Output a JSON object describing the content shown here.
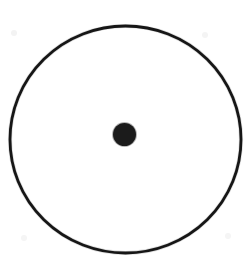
{
  "figure": {
    "title": "Circle with marked centre point",
    "background_color": "#ffffff",
    "canvas": {
      "width": 252,
      "height": 266
    },
    "elements": [
      {
        "name": "outer-circle",
        "kind": "circle-outline",
        "center_x": 125.5,
        "center_y": 139.5,
        "radius_x": 115.5,
        "radius_y": 113.5,
        "stroke_color": "#161616",
        "stroke_width": 2.8,
        "fill": "none"
      },
      {
        "name": "center-point",
        "kind": "filled-dot",
        "center_x": 124.5,
        "center_y": 134.5,
        "radius": 11.5,
        "fill_color": "#1b1b1b",
        "stroke_color": "#1b1b1b",
        "stroke_width": 0
      }
    ],
    "artifacts": [
      {
        "name": "scan-speck-top-left",
        "x": 14,
        "y": 33,
        "radius": 3,
        "color": "#f3f3f3"
      },
      {
        "name": "scan-speck-top-right",
        "x": 205,
        "y": 35,
        "radius": 3,
        "color": "#f4f4f4"
      },
      {
        "name": "scan-speck-bottom-left",
        "x": 24,
        "y": 238,
        "radius": 3,
        "color": "#f5f5f5"
      },
      {
        "name": "scan-speck-bottom-right",
        "x": 228,
        "y": 236,
        "radius": 3,
        "color": "#f5f5f5"
      }
    ],
    "caption": "Circle with marked centre point"
  }
}
